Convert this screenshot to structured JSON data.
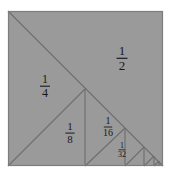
{
  "figure": {
    "shape": "square",
    "fill_color": "#9a9a9a",
    "line_color": "#6d6d6d",
    "border_color": "#7d7d7d",
    "background_color": "#ffffff",
    "label_color": "#181818",
    "square": {
      "x": 8,
      "y": 11,
      "size": 155
    }
  },
  "chart_data": {
    "type": "diagram",
    "subtitle": "",
    "xlabel": "",
    "ylabel": "",
    "series_sum": "1/2 + 1/4 + 1/8 + 1/16 + 1/32 + ... = 1",
    "grid": false,
    "legend": "none",
    "regions": [
      {
        "id": "half",
        "numerator": "1",
        "denominator": "2",
        "value": 0.5,
        "label_x": 122,
        "label_y": 57,
        "font_size": 13,
        "shape": "triangle",
        "points": "8,11 163,11 163,166"
      },
      {
        "id": "quarter",
        "numerator": "1",
        "denominator": "4",
        "value": 0.25,
        "label_x": 45,
        "label_y": 85,
        "font_size": 12,
        "shape": "triangle",
        "points": "8,11 8,166 85,89"
      },
      {
        "id": "eighth",
        "numerator": "1",
        "denominator": "8",
        "value": 0.125,
        "label_x": 70,
        "label_y": 132,
        "font_size": 11,
        "shape": "triangle",
        "points": "8,166 85,89 85,166"
      },
      {
        "id": "sixteenth",
        "numerator": "1",
        "denominator": "16",
        "value": 0.0625,
        "label_x": 108,
        "label_y": 126,
        "font_size": 10,
        "shape": "triangle",
        "points": "85,89 125,128 85,166"
      },
      {
        "id": "thirtysecond",
        "numerator": "1",
        "denominator": "32",
        "value": 0.03125,
        "label_x": 122,
        "label_y": 149,
        "font_size": 8,
        "shape": "triangle",
        "points": "85,166 125,128 125,166"
      }
    ],
    "lines": [
      {
        "name": "main-diagonal",
        "x1": 8,
        "y1": 11,
        "x2": 163,
        "y2": 166
      },
      {
        "name": "split-1",
        "x1": 8,
        "y1": 166,
        "x2": 85,
        "y2": 89
      },
      {
        "name": "vertical-1",
        "x1": 85,
        "y1": 89,
        "x2": 85,
        "y2": 166
      },
      {
        "name": "split-2",
        "x1": 85,
        "y1": 166,
        "x2": 125,
        "y2": 128
      },
      {
        "name": "vertical-2",
        "x1": 125,
        "y1": 128,
        "x2": 125,
        "y2": 166
      },
      {
        "name": "split-3",
        "x1": 125,
        "y1": 166,
        "x2": 144,
        "y2": 147
      },
      {
        "name": "vertical-3",
        "x1": 144,
        "y1": 147,
        "x2": 144,
        "y2": 166
      },
      {
        "name": "split-4",
        "x1": 144,
        "y1": 166,
        "x2": 154,
        "y2": 156
      },
      {
        "name": "vertical-4",
        "x1": 154,
        "y1": 156,
        "x2": 154,
        "y2": 166
      },
      {
        "name": "split-5",
        "x1": 154,
        "y1": 166,
        "x2": 159,
        "y2": 161
      },
      {
        "name": "vertical-5",
        "x1": 159,
        "y1": 161,
        "x2": 159,
        "y2": 166
      }
    ]
  }
}
